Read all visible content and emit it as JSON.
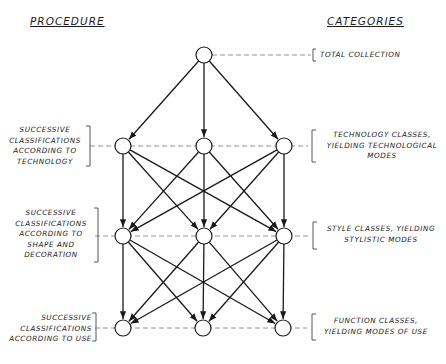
{
  "headers": {
    "procedure": "PROCEDURE",
    "categories": "CATEGORIES"
  },
  "procedure_labels": [
    {
      "id": "technology",
      "text": "SUCCESSIVE\nCLASSIFICATIONS\nACCORDING TO\nTECHNOLOGY"
    },
    {
      "id": "shape",
      "text": "SUCCESSIVE\nCLASSIFICATIONS\nACCORDING TO\nSHAPE AND\nDECORATION"
    },
    {
      "id": "use",
      "text": "SUCCESSIVE\nCLASSIFICATIONS\nACCORDING TO USE"
    }
  ],
  "category_labels": [
    {
      "id": "total",
      "text": "TOTAL COLLECTION"
    },
    {
      "id": "technology",
      "text": "TECHNOLOGY CLASSES,\nYIELDING TECHNOLOGICAL\nMODES"
    },
    {
      "id": "style",
      "text": "STYLE CLASSES, YIELDING\nSTYLISTIC MODES"
    },
    {
      "id": "function",
      "text": "FUNCTION CLASSES,\nYIELDING MODES OF USE"
    }
  ],
  "diagram": {
    "node_radius": 8,
    "levels": [
      {
        "name": "total-collection",
        "y": 55,
        "x": [
          204
        ]
      },
      {
        "name": "technology",
        "y": 146,
        "x": [
          123,
          204,
          284
        ]
      },
      {
        "name": "shape-decoration",
        "y": 236,
        "x": [
          123,
          204,
          284
        ]
      },
      {
        "name": "use",
        "y": 328,
        "x": [
          123,
          203,
          283
        ]
      }
    ],
    "edges": "each node connects with arrows to every node of the next level",
    "line_color": "#1a1a1a",
    "dash_color": "#888888"
  }
}
